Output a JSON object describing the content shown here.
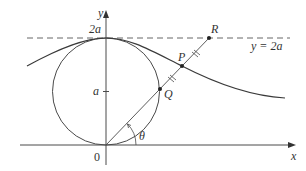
{
  "diagram": {
    "axes": {
      "x_label": "x",
      "y_label": "y",
      "origin_label": "0"
    },
    "ticks": {
      "y_tick_2a": "2a",
      "y_tick_a": "a"
    },
    "dashed_line_label": "y = 2a",
    "points": {
      "P": "P",
      "Q": "Q",
      "R": "R"
    },
    "angle_label": "θ",
    "colors": {
      "stroke": "#4a4a4a",
      "text": "#333333",
      "background": "#ffffff"
    }
  }
}
